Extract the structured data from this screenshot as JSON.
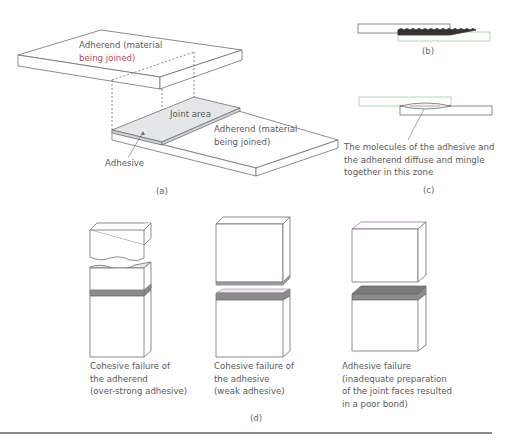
{
  "figure": {
    "panel_a": {
      "caption": "(a)",
      "top_adherend_line1": "Adherend (material",
      "top_adherend_line2": "being joined)",
      "joint_area": "Joint area",
      "bottom_adherend_line1": "Adherend (material",
      "bottom_adherend_line2": "being joined)",
      "adhesive": "Adhesive"
    },
    "panel_b": {
      "caption": "(b)"
    },
    "panel_c": {
      "caption": "(c)",
      "note_line1": "The molecules of the adhesive and",
      "note_line2": "the adherend diffuse and mingle",
      "note_line3": "together in this zone"
    },
    "panel_d": {
      "caption": "(d)",
      "failures": [
        {
          "line1": "Cohesive failure of",
          "line2": "the adherend",
          "line3": "(over-strong adhesive)"
        },
        {
          "line1": "Cohesive failure of",
          "line2": "the adhesive",
          "line3": "(weak adhesive)"
        },
        {
          "line1": "Adhesive failure",
          "line2": "(inadequate preparation",
          "line3": "of the joint faces resulted",
          "line4": "in a poor bond)"
        }
      ]
    }
  },
  "colors": {
    "line": "#6e6e6e",
    "adhesive_fill": "#e4e6ea",
    "adhesive_dark": "#8c8c8c",
    "accent_green": "#7fc97f",
    "accent_red": "#b04a5a"
  }
}
